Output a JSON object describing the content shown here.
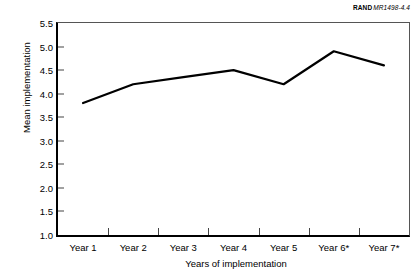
{
  "credit": {
    "organization": "RAND",
    "document": "MR1498-4.4"
  },
  "chart_data": {
    "type": "line",
    "title": "",
    "subtitle": "",
    "xlabel": "Years of implementation",
    "ylabel": "Mean implementation",
    "categories": [
      "Year 1",
      "Year 2",
      "Year 3",
      "Year 4",
      "Year 5",
      "Year 6*",
      "Year 7*"
    ],
    "values": [
      3.8,
      4.2,
      4.35,
      4.5,
      4.2,
      4.9,
      4.6
    ],
    "series": [
      {
        "name": "Mean implementation",
        "values": [
          3.8,
          4.2,
          4.35,
          4.5,
          4.2,
          4.9,
          4.6
        ],
        "color": "#000000"
      }
    ],
    "ylim": [
      1.0,
      5.5
    ],
    "yticks": [
      5.5,
      5.0,
      4.5,
      4.0,
      3.5,
      3.0,
      2.5,
      2.0,
      1.5,
      1.0
    ],
    "ytick_labels": [
      "5.5",
      "5.0",
      "4.5",
      "4.0",
      "3.5",
      "3.0",
      "2.5",
      "2.0",
      "1.5",
      "1.0"
    ],
    "grid": false,
    "legend": "none",
    "markers": false,
    "line_width": 2.2
  }
}
